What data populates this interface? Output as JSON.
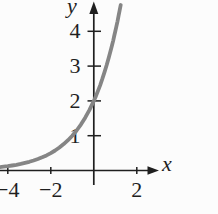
{
  "figure": {
    "background": "#fcfcfc",
    "axis_color": "#1f1f1f",
    "curve_color": "#858585",
    "x_axis_label": "x",
    "y_axis_label": "y",
    "x_tick_labels": [
      {
        "value": -4,
        "label": "−4"
      },
      {
        "value": -2,
        "label": "−2"
      },
      {
        "value": 2,
        "label": "2"
      }
    ],
    "y_tick_labels": [
      {
        "value": 1,
        "label": "1"
      },
      {
        "value": 2,
        "label": "2"
      },
      {
        "value": 3,
        "label": "3"
      },
      {
        "value": 4,
        "label": "4"
      }
    ]
  },
  "chart_data": {
    "type": "line",
    "title": "",
    "xlabel": "x",
    "ylabel": "y",
    "xlim": [
      -4.5,
      3.1
    ],
    "ylim": [
      -0.6,
      4.9
    ],
    "grid": false,
    "legend": false,
    "x_ticks": [
      -4,
      -2,
      2
    ],
    "y_ticks": [
      1,
      2,
      3,
      4
    ],
    "y_intercept": [
      0,
      2
    ],
    "series": [
      {
        "name": "exponential-curve",
        "points": [
          [
            -4.4,
            0.095
          ],
          [
            -4.2,
            0.109
          ],
          [
            -4,
            0.125
          ],
          [
            -3.8,
            0.144
          ],
          [
            -3.6,
            0.165
          ],
          [
            -3.4,
            0.19
          ],
          [
            -3.2,
            0.218
          ],
          [
            -3,
            0.25
          ],
          [
            -2.8,
            0.287
          ],
          [
            -2.6,
            0.33
          ],
          [
            -2.4,
            0.379
          ],
          [
            -2.2,
            0.435
          ],
          [
            -2,
            0.5
          ],
          [
            -1.8,
            0.574
          ],
          [
            -1.6,
            0.66
          ],
          [
            -1.4,
            0.758
          ],
          [
            -1.2,
            0.871
          ],
          [
            -1,
            1
          ],
          [
            -0.8,
            1.149
          ],
          [
            -0.6,
            1.32
          ],
          [
            -0.4,
            1.516
          ],
          [
            -0.2,
            1.741
          ],
          [
            0,
            2
          ],
          [
            0.1,
            2.144
          ],
          [
            0.2,
            2.297
          ],
          [
            0.3,
            2.462
          ],
          [
            0.4,
            2.639
          ],
          [
            0.5,
            2.828
          ],
          [
            0.6,
            3.031
          ],
          [
            0.7,
            3.249
          ],
          [
            0.8,
            3.482
          ],
          [
            0.85,
            3.605
          ],
          [
            0.9,
            3.732
          ],
          [
            0.95,
            3.864
          ],
          [
            1,
            4
          ],
          [
            1.05,
            4.141
          ],
          [
            1.1,
            4.287
          ],
          [
            1.15,
            4.438
          ],
          [
            1.2,
            4.595
          ],
          [
            1.25,
            4.757
          ]
        ]
      }
    ]
  }
}
